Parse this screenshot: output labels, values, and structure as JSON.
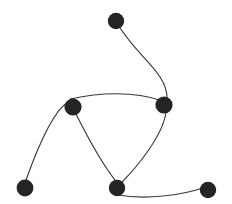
{
  "figure": {
    "width": 232,
    "height": 204,
    "background_color": "#ffffff",
    "node_color": "#242424",
    "edge_color": "#3a3a3a",
    "edge_width": 1.15,
    "node_radius": 8.2
  },
  "chart_data": {
    "type": "scatter",
    "title": "",
    "xlabel": "",
    "ylabel": "",
    "xlim": [
      0,
      232
    ],
    "ylim": [
      204,
      0
    ],
    "grid": false,
    "legend": "none",
    "nodes": [
      {
        "id": "n1",
        "label": "",
        "x": 116,
        "y": 21,
        "r": 8.2,
        "color": "#242424"
      },
      {
        "id": "n2",
        "label": "",
        "x": 164,
        "y": 105,
        "r": 8.6,
        "color": "#242424"
      },
      {
        "id": "n3",
        "label": "",
        "x": 73,
        "y": 107,
        "r": 8.6,
        "color": "#242424"
      },
      {
        "id": "n4",
        "label": "",
        "x": 25,
        "y": 188,
        "r": 8.4,
        "color": "#242424"
      },
      {
        "id": "n5",
        "label": "",
        "x": 117,
        "y": 188,
        "r": 8.2,
        "color": "#242424"
      },
      {
        "id": "n6",
        "label": "",
        "x": 208,
        "y": 190,
        "r": 8.2,
        "color": "#242424"
      }
    ],
    "edges": [
      {
        "source": "n1",
        "target": "n2",
        "curve": "M116,21 C 134,55 168,72 167,99"
      },
      {
        "source": "n2",
        "target": "n3",
        "curve": "M163,101 C 130,90 98,93 70,99"
      },
      {
        "source": "n3",
        "target": "n4",
        "curve": "M68,102 C 52,112 36,152 26,180"
      },
      {
        "source": "n3",
        "target": "n5",
        "curve": "M76,114 C 88,138 104,166 115,180"
      },
      {
        "source": "n2",
        "target": "n5",
        "curve": "M166,112 C 163,136 136,168 122,182"
      },
      {
        "source": "n5",
        "target": "n6",
        "curve": "M118,195 C 146,200 182,195 203,188"
      }
    ]
  }
}
